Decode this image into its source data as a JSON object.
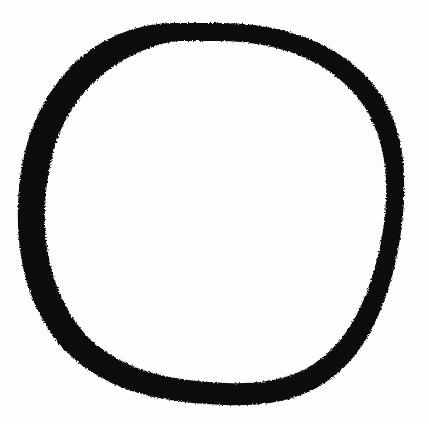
{
  "page": {
    "title": "Hand-drawn Circle",
    "width": 429,
    "height": 424,
    "background_color": "#fdfdfd"
  },
  "artwork": {
    "name": "hand-drawn-circle",
    "kind": "freehand-ink-ring",
    "stroke_color": "#0d0d0d",
    "fill_color": "none",
    "interior_color": "#fdfdfd",
    "closed": true,
    "bounding_box": {
      "x": 18,
      "y": 22,
      "width": 387,
      "height": 384
    },
    "center": {
      "x": 211,
      "y": 214
    },
    "radius_x": 193,
    "radius_y": 192,
    "stroke_width": {
      "min": 9,
      "max": 25,
      "left": 24,
      "top": 18,
      "right": 10,
      "bottom": 17,
      "bottom_left": 22,
      "top_right": 13
    },
    "texture": {
      "edge": "ragged",
      "speckles": "white paper grain visible within stroke",
      "speckle_color": "#fdfdfd"
    },
    "outline_path": "M 211 23 C 252 22 292 29 325 46 C 352 60 374 80 387 105 C 398 127 404 152 404 178 C 405 205 402 233 396 260 C 390 287 381 313 368 336 C 353 362 332 382 306 393 C 280 404 252 406 224 405 C 196 404 168 401 142 394 C 116 387 92 375 72 357 C 52 339 38 315 29 289 C 20 262 17 233 18 205 C 19 176 24 147 35 121 C 47 93 65 69 89 51 C 113 33 142 24 171 23 Z",
    "inner_path": "M 211 41 C 248 40 285 47 314 62 C 338 75 357 93 369 114 C 379 134 385 156 386 180 C 387 205 384 231 378 255 C 372 280 364 303 352 323 C 339 345 321 362 299 372 C 276 382 251 384 226 383 C 200 382 175 379 152 373 C 129 366 109 356 92 341 C 75 325 63 304 55 281 C 47 257 44 232 45 207 C 46 181 51 155 60 132 C 70 108 86 87 107 71 C 128 56 153 43 180 41 Z"
  }
}
